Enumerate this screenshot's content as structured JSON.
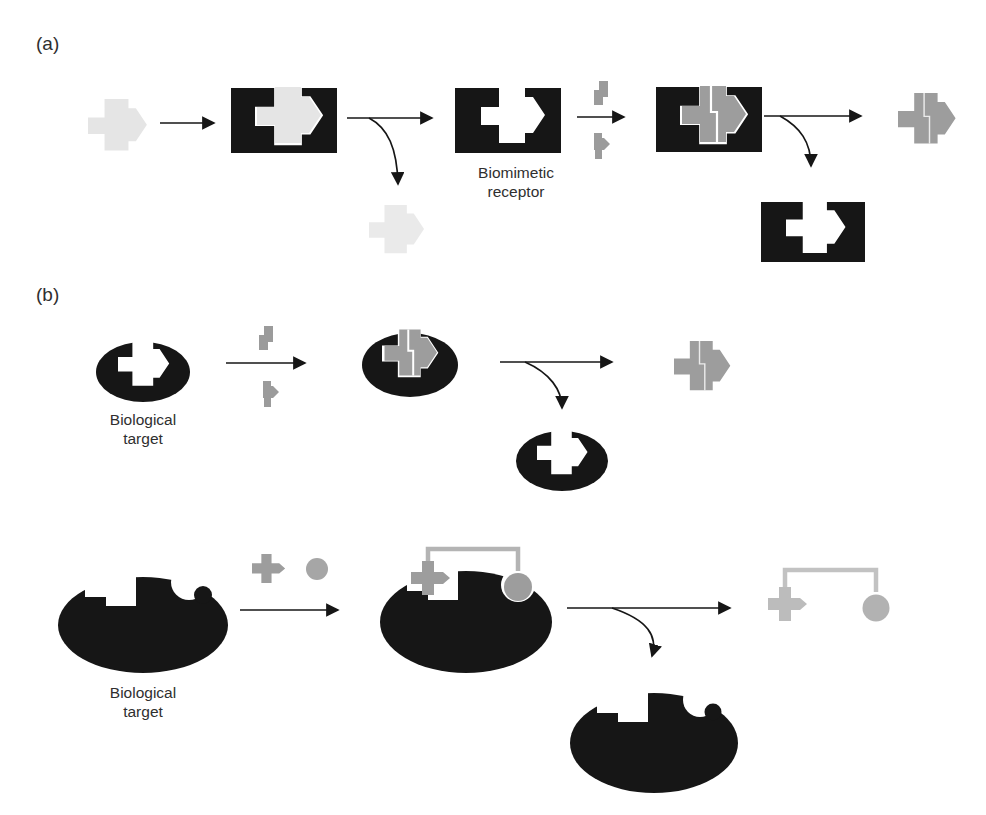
{
  "panel_labels": {
    "a": "(a)",
    "b": "(b)"
  },
  "captions": {
    "biomimetic_receptor": {
      "line1": "Biomimetic",
      "line2": "receptor"
    },
    "biological_target_top": {
      "line1": "Biological",
      "line2": "target"
    },
    "biological_target_bottom": {
      "line1": "Biological",
      "line2": "target"
    }
  },
  "colors": {
    "background": "#ffffff",
    "black_shape": "#161616",
    "template_light_gray": "#e5e5e5",
    "released_template_gray": "#eaeaea",
    "monomer_gray": "#9b9b9b",
    "product_gray": "#9d9d9d",
    "substrate_circle_gray": "#a6a6a6",
    "linker_gray": "#b4b4b4",
    "final_product_gray": "#bcbcbc",
    "text": "#2f2f2f"
  },
  "shapes": {
    "template-molecule-icon": "light gray block-arrow template",
    "polymer-matrix-icon": "black rectangle polymer block",
    "biomimetic-receptor-icon": "black rectangle with arrow-shaped cavity",
    "monomer-fragment-icons": "small gray zigzag piece and arrowhead piece",
    "assembled-product-icon": "gray block-arrow assembled from two pieces with white seam",
    "biological-target-ellipse-icon": "black ellipse with arrow-shaped cavity",
    "enzyme-ellipse-icon": "large black ellipse with stepped notch and round bite",
    "substrate-cross-icon": "gray cross piece with pointed tip",
    "substrate-circle-icon": "gray circle piece",
    "coupled-product-icon": "cross and circle joined by a gray linker"
  }
}
